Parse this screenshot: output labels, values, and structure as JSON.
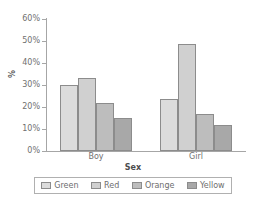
{
  "chart_data": {
    "type": "bar",
    "title": "",
    "xlabel": "Sex",
    "ylabel": "%",
    "categories": [
      "Boy",
      "Girl"
    ],
    "series": [
      {
        "name": "Green",
        "values": [
          30,
          23.6
        ],
        "color": "#dcdcdc"
      },
      {
        "name": "Red",
        "values": [
          33,
          48.6
        ],
        "color": "#d0d0d0"
      },
      {
        "name": "Orange",
        "values": [
          21.8,
          16.8
        ],
        "color": "#bdbdbd"
      },
      {
        "name": "Yellow",
        "values": [
          15,
          11.8
        ],
        "color": "#a8a8a8"
      }
    ],
    "ylim": [
      0,
      60
    ],
    "ytick_labels": [
      "0%",
      "10%",
      "20%",
      "30%",
      "40%",
      "50%",
      "60%"
    ],
    "ytick_values": [
      0,
      10,
      20,
      30,
      40,
      50,
      60
    ],
    "grid": false,
    "legend_position": "bottom"
  },
  "axes": {
    "y_title": "%",
    "x_title": "Sex"
  },
  "legend": {
    "entries": [
      {
        "label": "Green",
        "color": "#dcdcdc"
      },
      {
        "label": "Red",
        "color": "#d0d0d0"
      },
      {
        "label": "Orange",
        "color": "#bdbdbd"
      },
      {
        "label": "Yellow",
        "color": "#a8a8a8"
      }
    ]
  },
  "top_fragment": {
    "text": "",
    "note": "clipped text row at top edge of image"
  }
}
